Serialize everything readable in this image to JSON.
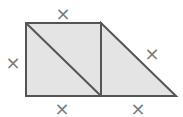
{
  "diagram": {
    "labels": {
      "top": "×",
      "left": "×",
      "bottom_left": "×",
      "hypotenuse": "×",
      "bottom_right": "×"
    },
    "colors": {
      "fill": "#e4e4e4",
      "stroke": "#555555",
      "label": "#7a7a7a"
    }
  }
}
